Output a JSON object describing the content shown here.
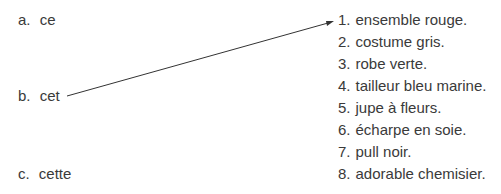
{
  "exercise": {
    "left_items": [
      {
        "letter": "a.",
        "word": "ce"
      },
      {
        "letter": "b.",
        "word": "cet"
      },
      {
        "letter": "c.",
        "word": "cette"
      }
    ],
    "right_items": [
      {
        "number": "1.",
        "text": "ensemble rouge."
      },
      {
        "number": "2.",
        "text": "costume gris."
      },
      {
        "number": "3.",
        "text": "robe verte."
      },
      {
        "number": "4.",
        "text": "tailleur bleu marine."
      },
      {
        "number": "5.",
        "text": "jupe à fleurs."
      },
      {
        "number": "6.",
        "text": "écharpe en soie."
      },
      {
        "number": "7.",
        "text": "pull noir."
      },
      {
        "number": "8.",
        "text": "adorable chemisier."
      }
    ],
    "connections": [
      {
        "from": "b",
        "to": "1"
      }
    ]
  }
}
